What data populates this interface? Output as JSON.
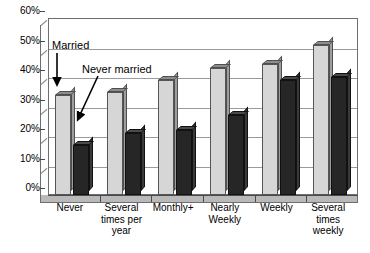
{
  "chart_data": {
    "type": "bar",
    "title": "",
    "subtitle": "",
    "xlabel": "",
    "ylabel": "",
    "ylim": [
      0,
      60
    ],
    "ytick_step": 10,
    "ytick_labels": [
      "0%",
      "10%",
      "20%",
      "30%",
      "40%",
      "50%",
      "60%"
    ],
    "ytick_values": [
      0,
      10,
      20,
      30,
      40,
      50,
      60
    ],
    "grid": true,
    "legend_position": "none",
    "style": "3d-clustered-column",
    "categories": [
      "Never",
      "Several times per year",
      "Monthly+",
      "Nearly Weekly",
      "Weekly",
      "Several times weekly"
    ],
    "category_lines": [
      [
        "Never"
      ],
      [
        "Several",
        "times per",
        "year"
      ],
      [
        "Monthly+"
      ],
      [
        "Nearly",
        "Weekly"
      ],
      [
        "Weekly"
      ],
      [
        "Several",
        "times",
        "weekly"
      ]
    ],
    "series": [
      {
        "name": "Married",
        "color": "#d6d6d6",
        "values": [
          34,
          35,
          39,
          43,
          44.5,
          51
        ]
      },
      {
        "name": "Never married",
        "color": "#262626",
        "values": [
          17,
          21,
          22,
          27,
          39,
          40
        ]
      }
    ],
    "annotations": [
      {
        "name": "married",
        "text": "Married",
        "arrow": "vertical-down",
        "points_to_series": "Married",
        "points_to_category": "Never"
      },
      {
        "name": "never-married",
        "text": "Never married",
        "arrow": "diagonal-down-left",
        "points_to_series": "Never married",
        "points_to_category": "Never"
      }
    ]
  },
  "colors": {
    "married_bar": "#d6d6d6",
    "never_married_bar": "#262626",
    "gridline": "#9a9a9a",
    "frame": "#6e6e6e",
    "floor": "#b9b9b9",
    "text": "#000000",
    "background": "#ffffff"
  }
}
